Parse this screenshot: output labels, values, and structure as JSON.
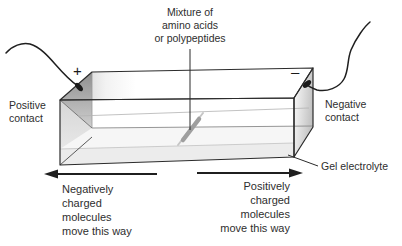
{
  "diagram_subject": "gel-electrophoresis-apparatus",
  "labels": {
    "mixture": "Mixture of\namino acids\nor polypeptides",
    "positive_contact": "Positive\ncontact",
    "negative_contact": "Negative\ncontact",
    "plus": "+",
    "minus": "–",
    "gel": "Gel electrolyte",
    "negative_flow": "Negatively\ncharged\nmolecules\nmove this way",
    "positive_flow": "Positively\ncharged\nmolecules\nmove this way"
  },
  "colors": {
    "line": "#2b2b2b",
    "text": "#2e2e2e",
    "wire": "#1f1f1f",
    "gel_fill": "#ececec",
    "gel_surface": "#f6f6f6",
    "shade_dark": "#8f8f8f",
    "shade_light": "#e8e8e8",
    "streak": "#9f9f9f"
  }
}
